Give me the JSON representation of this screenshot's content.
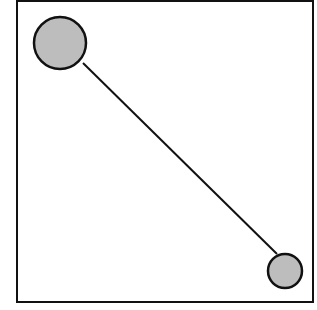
{
  "diagram": {
    "frame": {
      "x": 17,
      "y": 1,
      "width": 296,
      "height": 301,
      "stroke": "#111111"
    },
    "nodes": [
      {
        "id": "node-a",
        "cx": 60,
        "cy": 43,
        "r": 26,
        "fill": "#bdbdbd",
        "stroke": "#111111"
      },
      {
        "id": "node-b",
        "cx": 285,
        "cy": 271,
        "r": 17,
        "fill": "#bdbdbd",
        "stroke": "#111111"
      }
    ],
    "edges": [
      {
        "from": "node-a",
        "to": "node-b",
        "x1": 83,
        "y1": 63,
        "x2": 277,
        "y2": 254
      }
    ]
  }
}
